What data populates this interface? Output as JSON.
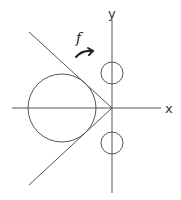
{
  "diagram": {
    "title": "",
    "labels": {
      "x_axis": "x",
      "y_axis": "y",
      "function": "f"
    },
    "colors": {
      "line": "#555555",
      "text": "#333333",
      "arrow": "#222222",
      "background": "#ffffff"
    },
    "elements": {
      "origin": {
        "x": 112,
        "y": 108
      },
      "large_circle": {
        "cx": 62,
        "cy": 108,
        "r": 34
      },
      "small_circle_upper": {
        "cx": 112,
        "cy": 73,
        "r": 11
      },
      "small_circle_lower": {
        "cx": 112,
        "cy": 143,
        "r": 11
      },
      "tangent_line_upper": {
        "x1": 29,
        "y1": 32,
        "x2": 112,
        "y2": 108
      },
      "tangent_line_lower": {
        "x1": 29,
        "y1": 185,
        "x2": 112,
        "y2": 108
      },
      "arrow": {
        "from": [
          75,
          56
        ],
        "to": [
          93,
          51
        ],
        "direction": "clockwise-right"
      }
    }
  }
}
